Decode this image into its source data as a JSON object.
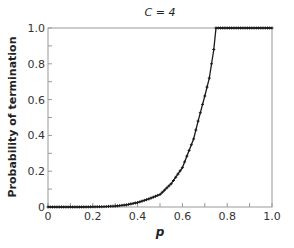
{
  "chart_data": {
    "type": "line",
    "title": "C = 4",
    "xlabel": "p",
    "ylabel": "Probability of termination",
    "xlim": [
      0,
      1.0
    ],
    "ylim": [
      0,
      1.0
    ],
    "xticks": [
      "0",
      "0.2",
      "0.4",
      "0.6",
      "0.8",
      "1.0"
    ],
    "yticks": [
      "0",
      "0.2",
      "0.4",
      "0.6",
      "0.8",
      "1.0"
    ],
    "grid": false,
    "legend": null,
    "series": [
      {
        "name": "C = 4",
        "color": "#1a1a1a",
        "marker": "+",
        "x": [
          0.0,
          0.05,
          0.1,
          0.15,
          0.2,
          0.25,
          0.3,
          0.35,
          0.4,
          0.45,
          0.5,
          0.55,
          0.6,
          0.65,
          0.67,
          0.7,
          0.72,
          0.74,
          0.75,
          0.8,
          0.85,
          0.9,
          0.95,
          1.0
        ],
        "y": [
          0.0,
          0.0,
          0.0,
          0.0,
          0.001,
          0.002,
          0.005,
          0.012,
          0.025,
          0.045,
          0.07,
          0.13,
          0.22,
          0.38,
          0.48,
          0.62,
          0.72,
          0.88,
          1.0,
          1.0,
          1.0,
          1.0,
          1.0,
          1.0
        ]
      }
    ]
  }
}
